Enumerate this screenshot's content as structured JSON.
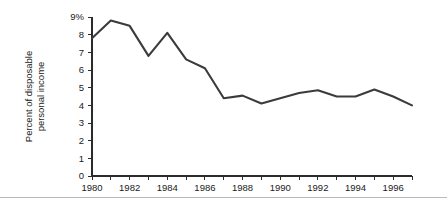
{
  "chart_data": {
    "type": "line",
    "title": "",
    "subtitle": "",
    "xlabel": "",
    "ylabel": "Percent of disposable personal income",
    "ylabel_lines": [
      "Percent of disposable",
      "personal income"
    ],
    "x": [
      1980,
      1981,
      1982,
      1983,
      1984,
      1985,
      1986,
      1987,
      1988,
      1989,
      1990,
      1991,
      1992,
      1993,
      1994,
      1995,
      1996,
      1997
    ],
    "values": [
      7.8,
      8.8,
      8.5,
      6.8,
      8.1,
      6.6,
      6.1,
      4.4,
      4.55,
      4.1,
      4.4,
      4.7,
      4.85,
      4.5,
      4.5,
      4.9,
      4.5,
      4.0
    ],
    "series": [
      {
        "name": "Percent of disposable personal income",
        "values": [
          7.8,
          8.8,
          8.5,
          6.8,
          8.1,
          6.6,
          6.1,
          4.4,
          4.55,
          4.1,
          4.4,
          4.7,
          4.85,
          4.5,
          4.5,
          4.9,
          4.5,
          4.0
        ]
      }
    ],
    "xlim": [
      1980,
      1997
    ],
    "ylim": [
      0,
      9
    ],
    "y_ticks": [
      0,
      1,
      2,
      3,
      4,
      5,
      6,
      7,
      8,
      9
    ],
    "y_tick_labels": [
      "0",
      "1",
      "2",
      "3",
      "4",
      "5",
      "6",
      "7",
      "8",
      "9%"
    ],
    "x_ticks": [
      1980,
      1981,
      1982,
      1983,
      1984,
      1985,
      1986,
      1987,
      1988,
      1989,
      1990,
      1991,
      1992,
      1993,
      1994,
      1995,
      1996,
      1997
    ],
    "x_tick_labels": [
      "1980",
      "",
      "1982",
      "",
      "1984",
      "",
      "1986",
      "",
      "1988",
      "",
      "1990",
      "",
      "1992",
      "",
      "1994",
      "",
      "1996",
      ""
    ],
    "grid": false,
    "legend": false,
    "legend_position": "none",
    "line_color": "#3b3b3b",
    "axis_color": "#2b2b2b",
    "background_color": "#ffffff"
  }
}
